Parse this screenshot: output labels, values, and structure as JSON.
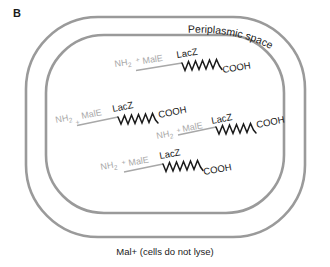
{
  "panel": {
    "letter": "B"
  },
  "labels": {
    "periplasm": "Periplasmic space",
    "caption": "Mal+ (cells do not lyse)"
  },
  "colors": {
    "membrane": "#9a9a9a",
    "n_terminus_text": "#a8a8a8",
    "male_text": "#a8a8a8",
    "male_line": "#a8a8a8",
    "lacz_text": "#1a1a1a",
    "lacz_zigzag": "#1a1a1a",
    "cooh_text": "#1a1a1a",
    "caption_text": "#1a1a1a",
    "background": "#ffffff"
  },
  "fusion_proteins": [
    {
      "id": "fusion-1",
      "n_terminus": "NH",
      "n_subscript": "2",
      "n_superscript": "+",
      "male": "MalE",
      "lacz": "LacZ",
      "c_terminus": "COOH"
    },
    {
      "id": "fusion-2",
      "n_terminus": "NH",
      "n_subscript": "2",
      "n_superscript": "+",
      "male": "MalE",
      "lacz": "LacZ",
      "c_terminus": "COOH"
    },
    {
      "id": "fusion-3",
      "n_terminus": "NH",
      "n_subscript": "2",
      "n_superscript": "+",
      "male": "MalE",
      "lacz": "LacZ",
      "c_terminus": "COOH"
    },
    {
      "id": "fusion-4",
      "n_terminus": "NH",
      "n_subscript": "2",
      "n_superscript": "+",
      "male": "MalE",
      "lacz": "LacZ",
      "c_terminus": "COOH"
    }
  ]
}
